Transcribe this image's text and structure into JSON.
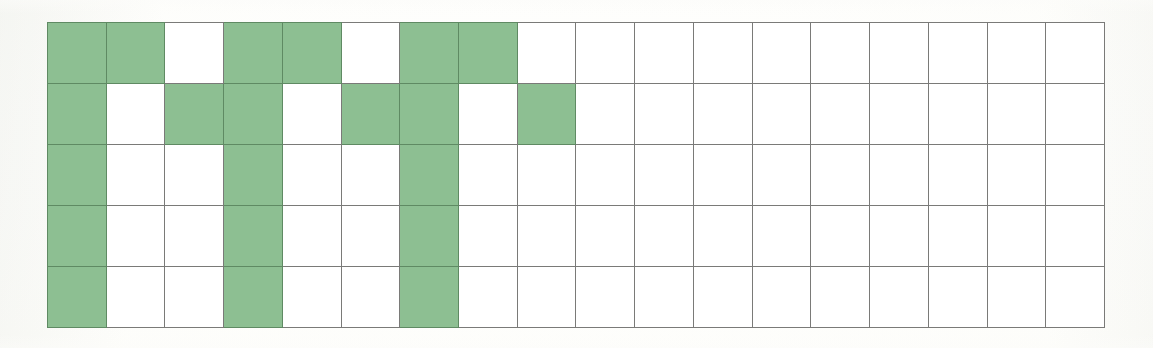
{
  "figure": {
    "type": "grid-worksheet",
    "background_color": "#fdfdfb",
    "paper_color": "#ffffff"
  },
  "grid": {
    "columns": 18,
    "rows": 5,
    "cell_width_px": 58.7,
    "cell_height_px": 61,
    "left_px": 47,
    "top_px": 22,
    "width_px": 1057,
    "height_px": 305,
    "border_color": "#7a7a78",
    "filled_color": "#8dbf92",
    "filled_border_color": "#5f8a63",
    "empty_color": "#ffffff"
  },
  "chart_data": {
    "type": "heatmap",
    "title": "",
    "subtitle": "",
    "xlabel": "",
    "ylabel": "",
    "legend": [],
    "grid_on": true,
    "columns": 18,
    "rows": 5,
    "column_labels": [
      "1",
      "2",
      "3",
      "4",
      "5",
      "6",
      "7",
      "8",
      "9",
      "10",
      "11",
      "12",
      "13",
      "14",
      "15",
      "16",
      "17",
      "18"
    ],
    "row_labels": [
      "1",
      "2",
      "3",
      "4",
      "5"
    ],
    "value_meaning": {
      "1": "shaded green square",
      "0": "empty white square"
    },
    "cells": [
      [
        1,
        1,
        0,
        1,
        1,
        0,
        1,
        1,
        0,
        0,
        0,
        0,
        0,
        0,
        0,
        0,
        0,
        0
      ],
      [
        1,
        0,
        1,
        1,
        0,
        1,
        1,
        0,
        1,
        0,
        0,
        0,
        0,
        0,
        0,
        0,
        0,
        0
      ],
      [
        1,
        0,
        0,
        1,
        0,
        0,
        1,
        0,
        0,
        0,
        0,
        0,
        0,
        0,
        0,
        0,
        0,
        0
      ],
      [
        1,
        0,
        0,
        1,
        0,
        0,
        1,
        0,
        0,
        0,
        0,
        0,
        0,
        0,
        0,
        0,
        0,
        0
      ],
      [
        1,
        0,
        0,
        1,
        0,
        0,
        1,
        0,
        0,
        0,
        0,
        0,
        0,
        0,
        0,
        0,
        0,
        0
      ]
    ],
    "column_totals": [
      5,
      1,
      1,
      5,
      1,
      1,
      5,
      1,
      1,
      0,
      0,
      0,
      0,
      0,
      0,
      0,
      0,
      0
    ],
    "row_totals": [
      6,
      6,
      3,
      3,
      3
    ],
    "total_filled": 21,
    "total_cells": 90
  }
}
